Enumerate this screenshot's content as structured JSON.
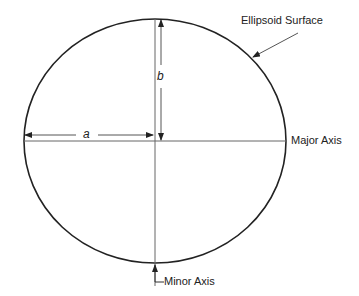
{
  "diagram": {
    "labels": {
      "surface": "Ellipsoid Surface",
      "major_axis": "Major Axis",
      "minor_axis": "Minor Axis",
      "semi_major": "a",
      "semi_minor": "b"
    },
    "colors": {
      "line": "#222222",
      "axis": "#666666",
      "background": "#ffffff"
    }
  }
}
